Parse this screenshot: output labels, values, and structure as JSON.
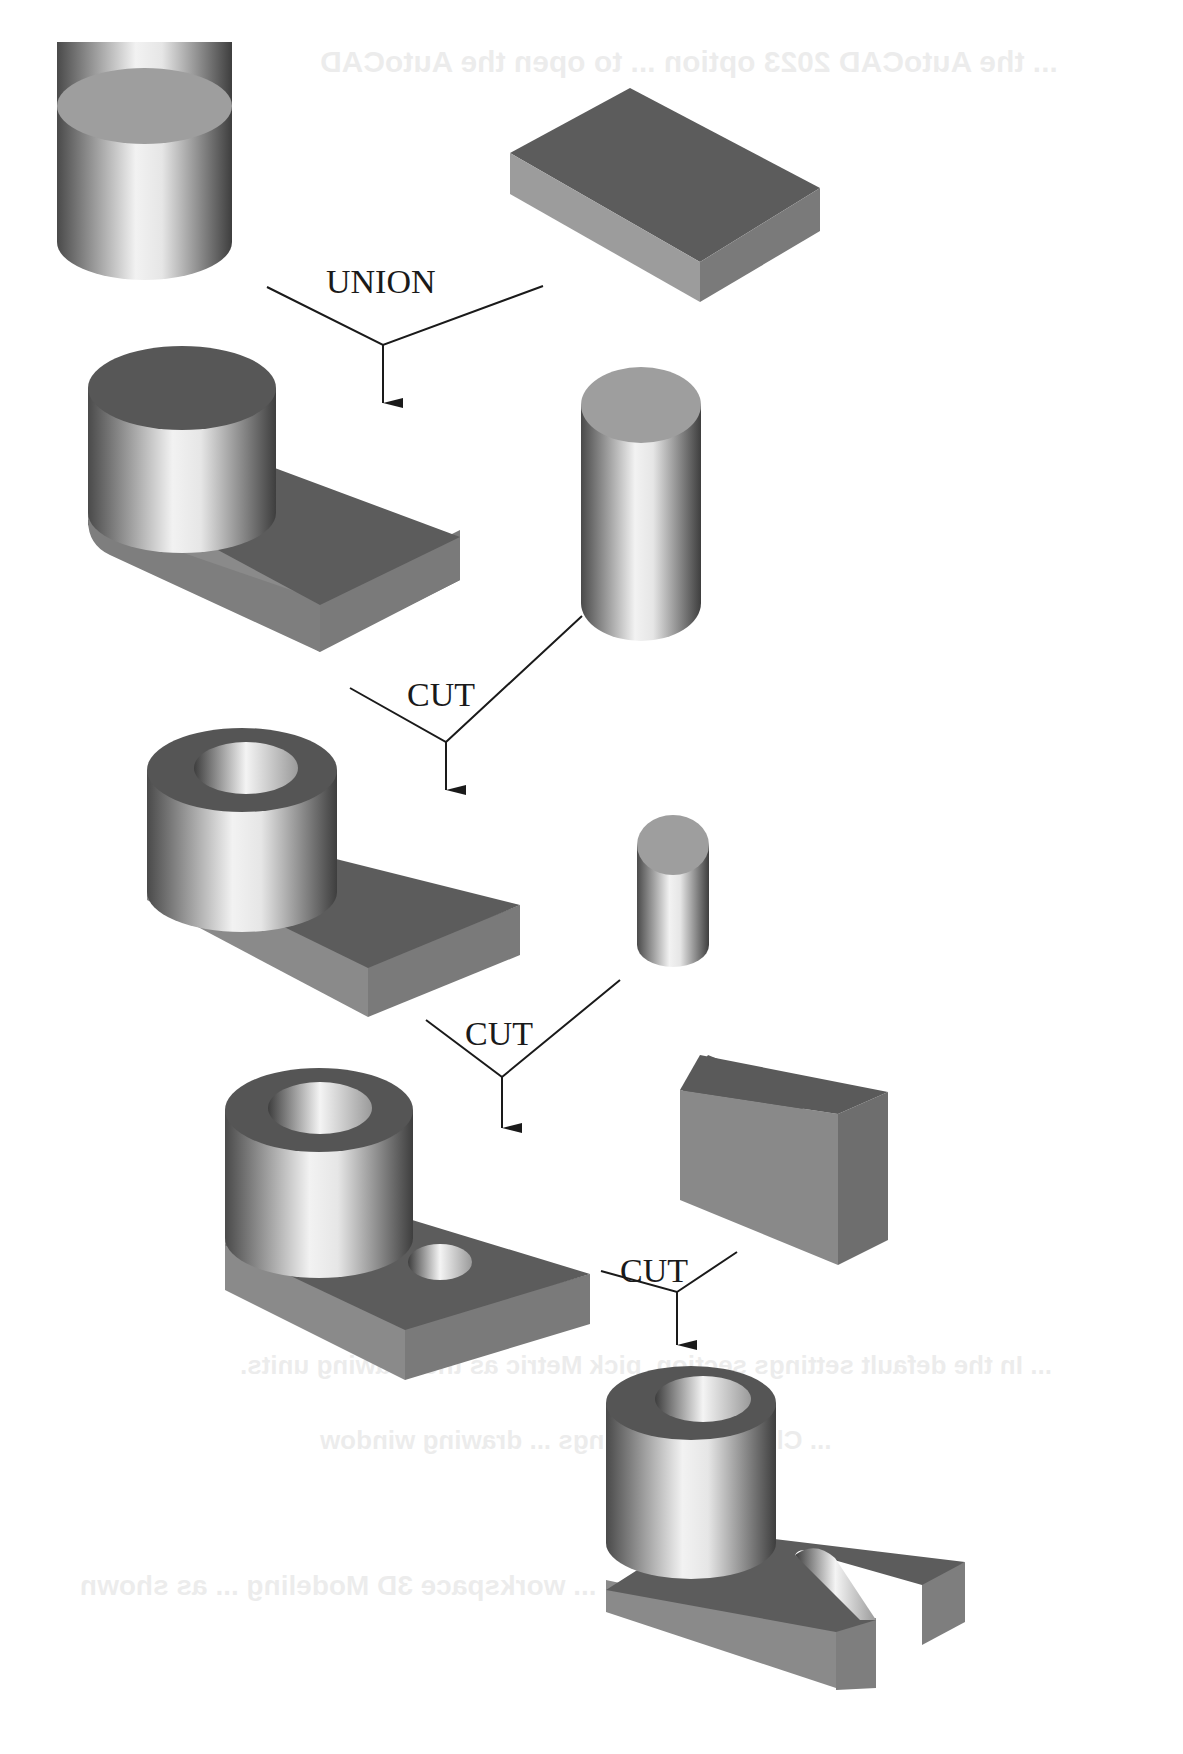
{
  "diagram": {
    "type": "csg-boolean-operation-flow",
    "operations": [
      {
        "label": "UNION",
        "inputs": [
          "cylinder",
          "rectangular-block"
        ],
        "result": "cylinder-on-block"
      },
      {
        "label": "CUT",
        "inputs": [
          "cylinder-on-block",
          "tall-cylinder"
        ],
        "result": "hollow-boss-on-block"
      },
      {
        "label": "CUT",
        "inputs": [
          "hollow-boss-on-block",
          "small-cylinder"
        ],
        "result": "boss-block-with-hole"
      },
      {
        "label": "CUT",
        "inputs": [
          "boss-block-with-hole",
          "box"
        ],
        "result": "slotted-bracket"
      }
    ],
    "colors": {
      "top_face": "#5c5c5c",
      "light_top": "#9a9a9a",
      "side_face": "#7a7a7a",
      "front_face": "#8c8c8c",
      "line": "#1a1a1a",
      "background": "#ffffff"
    }
  },
  "bleed_through": [
    "... the AutoCAD 2023 option ... to open the AutoCAD",
    "... In the default settings section, pick Metric as the drawing units.",
    "... Click OK ... settings ... drawing window",
    "... workspace 3D Modeling ... as shown"
  ]
}
